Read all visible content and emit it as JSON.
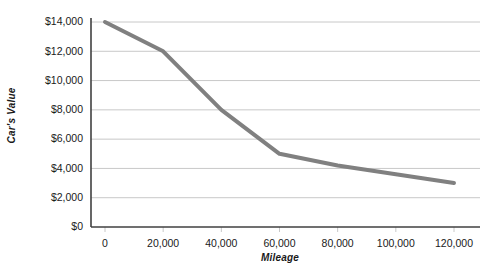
{
  "chart_data": {
    "type": "line",
    "title": "",
    "xlabel": "Mileage",
    "ylabel": "Car's Value",
    "x": [
      0,
      20000,
      40000,
      60000,
      80000,
      100000,
      120000
    ],
    "values": [
      14000,
      12000,
      8000,
      5000,
      4200,
      3600,
      3000
    ],
    "series": [
      {
        "name": "Car's Value",
        "values": [
          14000,
          12000,
          8000,
          5000,
          4200,
          3600,
          3000
        ]
      }
    ],
    "xlim": [
      0,
      120000
    ],
    "ylim": [
      0,
      14000
    ],
    "xticks": [
      0,
      20000,
      40000,
      60000,
      80000,
      100000,
      120000
    ],
    "xtick_labels": [
      "0",
      "20,000",
      "40,000",
      "60,000",
      "80,000",
      "100,000",
      "120,000"
    ],
    "yticks": [
      0,
      2000,
      4000,
      6000,
      8000,
      10000,
      12000,
      14000
    ],
    "ytick_labels": [
      "$0",
      "$2,000",
      "$4,000",
      "$6,000",
      "$8,000",
      "$10,000",
      "$12,000",
      "$14,000"
    ],
    "grid": true,
    "grid_axis": "y",
    "legend": false,
    "legend_position": "none",
    "line_color": "#808080",
    "line_width": 4,
    "axis_color": "#404040",
    "grid_color": "#c8c8c8",
    "background_color": "#ffffff",
    "text_color": "#1a1a1a"
  }
}
